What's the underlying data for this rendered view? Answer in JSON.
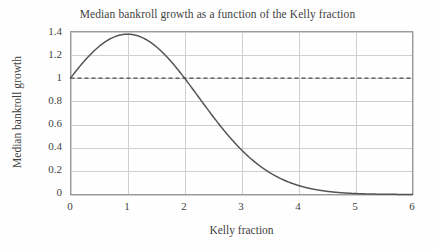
{
  "chart_data": {
    "type": "line",
    "title": "Median bankroll growth as a function of the Kelly fraction",
    "xlabel": "Kelly fraction",
    "ylabel": "Median bankroll growth",
    "xlim": [
      0,
      6
    ],
    "ylim": [
      0,
      1.4
    ],
    "grid": true,
    "legend": "none",
    "xticks": [
      "0",
      "1",
      "2",
      "3",
      "4",
      "5",
      "6"
    ],
    "yticks": [
      "0",
      "0.2",
      "0.4",
      "0.6",
      "0.8",
      "1",
      "1.2",
      "1.4"
    ],
    "xtick_values": [
      0,
      1,
      2,
      3,
      4,
      5,
      6
    ],
    "ytick_values": [
      0,
      0.2,
      0.4,
      0.6,
      0.8,
      1,
      1.2,
      1.4
    ],
    "series": [
      {
        "name": "Median bankroll growth",
        "style": "solid",
        "color": "#555555",
        "x": [
          0,
          0.1,
          0.2,
          0.3,
          0.4,
          0.5,
          0.6,
          0.7,
          0.8,
          0.9,
          1,
          1.1,
          1.2,
          1.3,
          1.4,
          1.5,
          1.6,
          1.7,
          1.8,
          1.9,
          2,
          2.1,
          2.2,
          2.3,
          2.4,
          2.5,
          2.6,
          2.7,
          2.8,
          2.9,
          3,
          3.2,
          3.4,
          3.6,
          3.8,
          4,
          4.2,
          4.4,
          4.6,
          4.8,
          5,
          5.2,
          5.4,
          5.6,
          5.8,
          6
        ],
        "values": [
          1.0,
          1.063,
          1.12,
          1.171,
          1.216,
          1.254,
          1.286,
          1.312,
          1.331,
          1.343,
          1.377,
          1.343,
          1.331,
          1.312,
          1.286,
          1.254,
          1.216,
          1.171,
          1.12,
          1.063,
          1.0,
          0.935,
          0.868,
          0.801,
          0.734,
          0.67,
          0.607,
          0.548,
          0.492,
          0.44,
          0.392,
          0.307,
          0.236,
          0.178,
          0.132,
          0.096,
          0.068,
          0.048,
          0.033,
          0.022,
          0.015,
          0.0095,
          0.006,
          0.0037,
          0.0022,
          0.0013
        ]
      },
      {
        "name": "Break-even reference",
        "style": "dashed",
        "color": "#4a4a4a",
        "x": [
          0,
          6
        ],
        "values": [
          1,
          1
        ]
      }
    ],
    "peak": {
      "x": 1,
      "y": 1.377
    },
    "break_even_crossings": [
      0,
      2
    ]
  }
}
